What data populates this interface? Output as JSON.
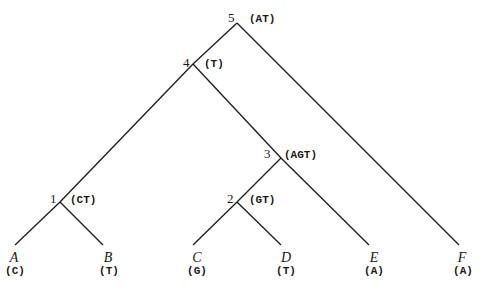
{
  "diagram": {
    "type": "phylogenetic-tree",
    "internal_nodes": [
      {
        "id": "5",
        "label": "5",
        "state": "(AT)"
      },
      {
        "id": "4",
        "label": "4",
        "state": "(T)"
      },
      {
        "id": "3",
        "label": "3",
        "state": "(AGT)"
      },
      {
        "id": "2",
        "label": "2",
        "state": "(GT)"
      },
      {
        "id": "1",
        "label": "1",
        "state": "(CT)"
      }
    ],
    "leaves": [
      {
        "id": "A",
        "name": "A",
        "state": "(C)"
      },
      {
        "id": "B",
        "name": "B",
        "state": "(T)"
      },
      {
        "id": "C",
        "name": "C",
        "state": "(G)"
      },
      {
        "id": "D",
        "name": "D",
        "state": "(T)"
      },
      {
        "id": "E",
        "name": "E",
        "state": "(A)"
      },
      {
        "id": "F",
        "name": "F",
        "state": "(A)"
      }
    ],
    "edges": [
      [
        "5",
        "4"
      ],
      [
        "5",
        "F"
      ],
      [
        "4",
        "1"
      ],
      [
        "4",
        "3"
      ],
      [
        "3",
        "2"
      ],
      [
        "3",
        "E"
      ],
      [
        "2",
        "C"
      ],
      [
        "2",
        "D"
      ],
      [
        "1",
        "A"
      ],
      [
        "1",
        "B"
      ]
    ]
  }
}
